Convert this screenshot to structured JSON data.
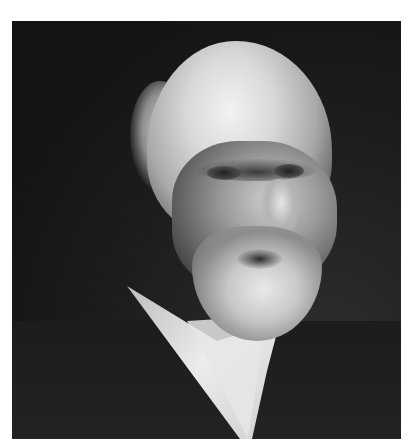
{
  "image": {
    "type": "photograph",
    "style": "black-and-white portrait",
    "subject": "elderly man with white hair, mustache and full white beard, wearing dark suit and white collar",
    "colors": {
      "background": "#151515",
      "hair": "#d9d9d9",
      "beard": "#e0e0e0",
      "suit": "#1f1f1f",
      "collar": "#e8e8e8",
      "page": "#ffffff"
    }
  }
}
